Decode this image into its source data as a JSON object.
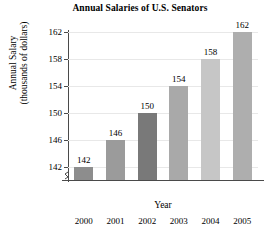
{
  "chart_data": {
    "type": "bar",
    "title": "Annual Salaries of U.S. Senators",
    "xlabel": "Year",
    "ylabel_line1": "Annual Salary",
    "ylabel_line2": "(thousands of dollars)",
    "categories": [
      "2000",
      "2001",
      "2002",
      "2003",
      "2004",
      "2005"
    ],
    "values": [
      142,
      146,
      150,
      154,
      158,
      162
    ],
    "value_labels": [
      "142",
      "146",
      "150",
      "154",
      "158",
      "162"
    ],
    "ytick_labels": [
      "142",
      "146",
      "150",
      "154",
      "158",
      "162"
    ],
    "yticks": [
      142,
      146,
      150,
      154,
      158,
      162
    ],
    "ylim": [
      140,
      162
    ],
    "axis_break": true,
    "grid": true,
    "legend": "none",
    "bar_colors": [
      "#8d8d8d",
      "#9b9b9b",
      "#797979",
      "#a9a9a9",
      "#c6c6c6",
      "#aeaeae"
    ]
  }
}
